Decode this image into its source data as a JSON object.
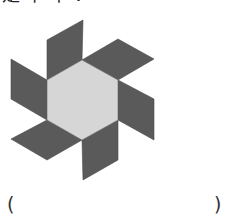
{
  "question": {
    "text_partial": "是下平：",
    "note_visible": "top line cropped; only bottoms of glyphs visible"
  },
  "figure": {
    "colors": {
      "hexagon_fill": "#d6d6d6",
      "parallelogram_fill": "#5a5a5a",
      "edge": "#4a4a4a"
    },
    "hexagon": "82,60 118,80 118,120 82,140 47,120 47,80",
    "parallelograms": [
      {
        "name": "top",
        "points": "47,80 47,40 83,20 82,60"
      },
      {
        "name": "upper-right",
        "points": "82,60 118,39 154,59 118,80"
      },
      {
        "name": "right",
        "points": "118,80 154,99 154,140 118,120"
      },
      {
        "name": "bottom",
        "points": "118,120 118,160 83,180 82,140"
      },
      {
        "name": "lower-left",
        "points": "82,140 47,160 11,139 47,120"
      },
      {
        "name": "left",
        "points": "47,120 11,99 11,59 47,80"
      }
    ]
  },
  "answer": {
    "left_paren": "(",
    "right_paren": ")",
    "value": ""
  }
}
